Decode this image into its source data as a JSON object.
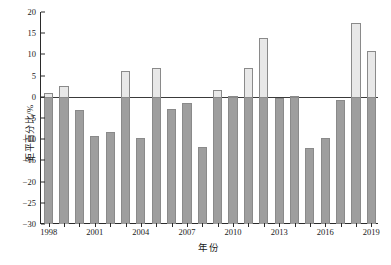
{
  "chart_data": {
    "type": "bar",
    "title": "",
    "xlabel": "年份",
    "ylabel": "距平百分比/%",
    "ylim": [
      -30,
      20
    ],
    "yticks": [
      20,
      15,
      10,
      5,
      0,
      -5,
      -10,
      -15,
      -20,
      -25,
      -30
    ],
    "ytick_labels": [
      "20",
      "15",
      "10",
      "5",
      "0",
      "−5",
      "−10",
      "−15",
      "−20",
      "−25",
      "−30"
    ],
    "xtick_labels": [
      "1998",
      "2001",
      "2004",
      "2007",
      "2010",
      "2013",
      "2016",
      "2019"
    ],
    "grid": false,
    "legend": "none",
    "zero_reference_line": true,
    "baseline": -30,
    "categories": [
      "1998",
      "1999",
      "2000",
      "2001",
      "2002",
      "2003",
      "2004",
      "2005",
      "2006",
      "2007",
      "2008",
      "2009",
      "2010",
      "2011",
      "2012",
      "2013",
      "2014",
      "2015",
      "2016",
      "2017",
      "2018",
      "2019"
    ],
    "values": [
      1.0,
      2.6,
      -3.2,
      -9.2,
      -8.2,
      6.2,
      -9.6,
      6.9,
      -2.8,
      -1.5,
      -11.9,
      1.5,
      0.3,
      6.9,
      13.8,
      -0.2,
      0.2,
      -12.1,
      -9.8,
      -0.8,
      17.3,
      10.7
    ],
    "colors": {
      "positive_fill": "#e8e8e8",
      "negative_fill": "#9e9e9e",
      "bar_edge": "#8a8a8a",
      "axis": "#2b2b2b",
      "zero_line": "#3a3a3a",
      "background": "#ffffff"
    }
  }
}
